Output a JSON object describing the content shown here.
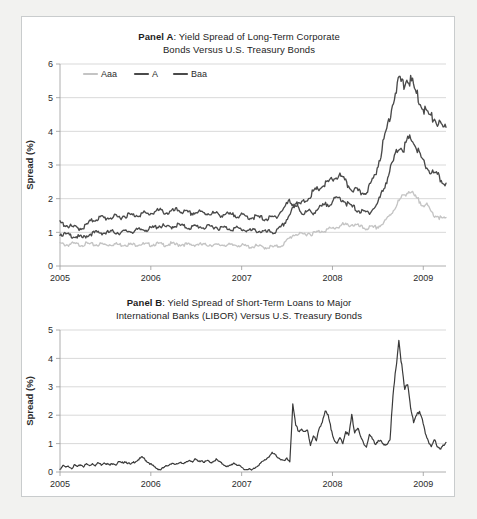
{
  "figure": {
    "background_color": "#ffffff",
    "frame_color": "#c9cccd",
    "page_color": "#f2f2f0"
  },
  "panel_a": {
    "title_bold": "Panel A",
    "title_rest": ": Yield Spread of Long-Term Corporate",
    "title_line2": "Bonds Versus U.S. Treasury Bonds",
    "ylabel": "Spread (%)",
    "legend": [
      {
        "label": "Aaa",
        "color": "#c4c4c4"
      },
      {
        "label": "A",
        "color": "#4a4a4a"
      },
      {
        "label": "Baa",
        "color": "#4a4a4a"
      }
    ]
  },
  "panel_b": {
    "title_bold": "Panel B",
    "title_rest": ": Yield Spread of Short-Term Loans to Major",
    "title_line2": "International Banks (LIBOR) Versus U.S. Treasury Bonds",
    "ylabel": "Spread (%)",
    "line_color": "#3a3a3a"
  },
  "chart_data": [
    {
      "type": "line",
      "title": "Panel A: Yield Spread of Long-Term Corporate Bonds Versus U.S. Treasury Bonds",
      "xlabel": "",
      "ylabel": "Spread (%)",
      "xlim": [
        2005.0,
        2009.25
      ],
      "ylim": [
        0,
        6
      ],
      "yticks": [
        0,
        1,
        2,
        3,
        4,
        5,
        6
      ],
      "xticks": [
        2005,
        2006,
        2007,
        2008,
        2009
      ],
      "xtick_labels": [
        "2005",
        "2006",
        "2007",
        "2008",
        "2009"
      ],
      "grid": true,
      "legend_position": "top-left-inside",
      "x": [
        2005.0,
        2005.04,
        2005.08,
        2005.12,
        2005.17,
        2005.21,
        2005.25,
        2005.29,
        2005.33,
        2005.38,
        2005.42,
        2005.46,
        2005.5,
        2005.54,
        2005.58,
        2005.62,
        2005.67,
        2005.71,
        2005.75,
        2005.79,
        2005.83,
        2005.88,
        2005.92,
        2005.96,
        2006.0,
        2006.04,
        2006.08,
        2006.12,
        2006.17,
        2006.21,
        2006.25,
        2006.29,
        2006.33,
        2006.38,
        2006.42,
        2006.46,
        2006.5,
        2006.54,
        2006.58,
        2006.62,
        2006.67,
        2006.71,
        2006.75,
        2006.79,
        2006.83,
        2006.88,
        2006.92,
        2006.96,
        2007.0,
        2007.04,
        2007.08,
        2007.12,
        2007.17,
        2007.21,
        2007.25,
        2007.29,
        2007.33,
        2007.38,
        2007.42,
        2007.46,
        2007.5,
        2007.54,
        2007.58,
        2007.62,
        2007.67,
        2007.71,
        2007.75,
        2007.79,
        2007.83,
        2007.88,
        2007.92,
        2007.96,
        2008.0,
        2008.04,
        2008.08,
        2008.12,
        2008.17,
        2008.21,
        2008.25,
        2008.29,
        2008.33,
        2008.38,
        2008.42,
        2008.46,
        2008.5,
        2008.54,
        2008.58,
        2008.62,
        2008.67,
        2008.71,
        2008.75,
        2008.79,
        2008.83,
        2008.88,
        2008.92,
        2008.96,
        2009.0,
        2009.04,
        2009.08,
        2009.12,
        2009.17,
        2009.21
      ],
      "series": [
        {
          "name": "Aaa",
          "color": "#c4c4c4",
          "values": [
            0.66,
            0.64,
            0.63,
            0.66,
            0.65,
            0.63,
            0.64,
            0.66,
            0.64,
            0.63,
            0.64,
            0.65,
            0.63,
            0.64,
            0.66,
            0.64,
            0.63,
            0.65,
            0.64,
            0.63,
            0.64,
            0.66,
            0.64,
            0.63,
            0.64,
            0.66,
            0.65,
            0.63,
            0.64,
            0.66,
            0.64,
            0.63,
            0.65,
            0.64,
            0.62,
            0.63,
            0.65,
            0.63,
            0.62,
            0.64,
            0.63,
            0.61,
            0.62,
            0.64,
            0.62,
            0.61,
            0.63,
            0.62,
            0.6,
            0.58,
            0.57,
            0.59,
            0.58,
            0.56,
            0.55,
            0.57,
            0.56,
            0.58,
            0.62,
            0.7,
            0.82,
            0.92,
            0.96,
            0.92,
            0.95,
            0.98,
            0.96,
            0.99,
            1.03,
            1.06,
            1.08,
            1.1,
            1.14,
            1.18,
            1.22,
            1.2,
            1.24,
            1.22,
            1.18,
            1.14,
            1.12,
            1.14,
            1.12,
            1.16,
            1.22,
            1.3,
            1.46,
            1.62,
            1.82,
            1.96,
            2.1,
            2.24,
            2.16,
            2.02,
            1.92,
            1.86,
            1.78,
            1.62,
            1.52,
            1.48,
            1.38,
            1.44
          ]
        },
        {
          "name": "A",
          "color": "#4a4a4a",
          "values": [
            0.96,
            0.94,
            0.92,
            0.9,
            0.88,
            0.86,
            0.84,
            0.9,
            0.96,
            0.98,
            1.0,
            0.99,
            0.98,
            1.0,
            1.02,
            1.0,
            0.99,
            1.02,
            1.04,
            1.03,
            1.05,
            1.08,
            1.1,
            1.08,
            1.12,
            1.16,
            1.2,
            1.18,
            1.14,
            1.16,
            1.2,
            1.22,
            1.18,
            1.16,
            1.14,
            1.16,
            1.18,
            1.16,
            1.14,
            1.16,
            1.18,
            1.15,
            1.12,
            1.14,
            1.12,
            1.1,
            1.12,
            1.1,
            1.08,
            1.06,
            1.04,
            1.06,
            1.04,
            1.02,
            1.0,
            1.02,
            1.0,
            1.06,
            1.16,
            1.32,
            1.52,
            1.7,
            1.88,
            1.62,
            1.56,
            1.62,
            1.58,
            1.66,
            1.72,
            1.78,
            1.84,
            1.9,
            1.96,
            2.02,
            1.98,
            1.86,
            1.78,
            1.72,
            1.66,
            1.6,
            1.58,
            1.62,
            1.7,
            1.84,
            2.1,
            2.4,
            2.72,
            3.04,
            3.36,
            3.58,
            3.48,
            3.72,
            3.8,
            3.56,
            3.32,
            3.08,
            2.92,
            2.8,
            2.72,
            2.66,
            2.5,
            2.46
          ]
        },
        {
          "name": "Baa",
          "color": "#4a4a4a",
          "values": [
            1.28,
            1.24,
            1.2,
            1.16,
            1.14,
            1.12,
            1.14,
            1.22,
            1.32,
            1.38,
            1.42,
            1.44,
            1.42,
            1.44,
            1.46,
            1.44,
            1.46,
            1.5,
            1.52,
            1.5,
            1.52,
            1.54,
            1.56,
            1.54,
            1.58,
            1.62,
            1.64,
            1.62,
            1.58,
            1.6,
            1.64,
            1.66,
            1.62,
            1.58,
            1.56,
            1.58,
            1.6,
            1.58,
            1.56,
            1.58,
            1.56,
            1.54,
            1.52,
            1.54,
            1.52,
            1.5,
            1.52,
            1.5,
            1.48,
            1.46,
            1.44,
            1.46,
            1.44,
            1.42,
            1.4,
            1.42,
            1.44,
            1.52,
            1.64,
            1.78,
            1.92,
            1.84,
            1.78,
            1.84,
            1.92,
            2.04,
            2.16,
            2.24,
            2.32,
            2.4,
            2.46,
            2.54,
            2.62,
            2.7,
            2.58,
            2.44,
            2.32,
            2.26,
            2.2,
            2.16,
            2.22,
            2.36,
            2.58,
            2.92,
            3.36,
            3.84,
            4.32,
            4.82,
            5.28,
            5.52,
            5.36,
            5.58,
            5.46,
            5.18,
            4.92,
            4.7,
            4.56,
            4.42,
            4.36,
            4.24,
            4.06,
            4.12
          ]
        }
      ]
    },
    {
      "type": "line",
      "title": "Panel B: Yield Spread of Short-Term Loans to Major International Banks (LIBOR) Versus U.S. Treasury Bonds",
      "xlabel": "",
      "ylabel": "Spread (%)",
      "xlim": [
        2005.0,
        2009.25
      ],
      "ylim": [
        0,
        5
      ],
      "yticks": [
        0,
        1,
        2,
        3,
        4,
        5
      ],
      "xticks": [
        2005,
        2006,
        2007,
        2008,
        2009
      ],
      "xtick_labels": [
        "2005",
        "2006",
        "2007",
        "2008",
        "2009"
      ],
      "grid": true,
      "series": [
        {
          "name": "LIBOR spread",
          "color": "#3a3a3a",
          "values": [
            0.1,
            0.22,
            0.16,
            0.2,
            0.14,
            0.24,
            0.18,
            0.26,
            0.2,
            0.28,
            0.22,
            0.3,
            0.24,
            0.32,
            0.26,
            0.34,
            0.28,
            0.24,
            0.32,
            0.26,
            0.36,
            0.3,
            0.38,
            0.32,
            0.26,
            0.34,
            0.4,
            0.46,
            0.52,
            0.42,
            0.34,
            0.26,
            0.18,
            0.12,
            0.08,
            0.14,
            0.2,
            0.26,
            0.32,
            0.24,
            0.3,
            0.36,
            0.28,
            0.34,
            0.42,
            0.38,
            0.44,
            0.36,
            0.42,
            0.34,
            0.4,
            0.32,
            0.38,
            0.44,
            0.36,
            0.3,
            0.24,
            0.18,
            0.24,
            0.32,
            0.26,
            0.2,
            0.14,
            0.08,
            0.12,
            0.06,
            0.14,
            0.22,
            0.3,
            0.38,
            0.46,
            0.56,
            0.66,
            0.6,
            0.52,
            0.44,
            0.38,
            0.46,
            0.38,
            2.34,
            1.62,
            1.44,
            1.52,
            1.38,
            1.46,
            0.96,
            1.3,
            1.08,
            1.54,
            1.8,
            2.12,
            1.96,
            1.52,
            1.18,
            0.96,
            1.2,
            1.04,
            1.44,
            1.26,
            1.98,
            1.42,
            1.56
          ],
          "values_cont": [
            1.22,
            1.04,
            0.88,
            1.32,
            1.16,
            0.98,
            1.12,
            1.06,
            0.92,
            1.0,
            1.18,
            2.62,
            3.64,
            4.66,
            3.7,
            2.86,
            3.12,
            2.3,
            1.72,
            1.96,
            2.14,
            1.9,
            1.3,
            1.06,
            0.92,
            1.18,
            0.86,
            0.82,
            0.96,
            1.04
          ]
        }
      ],
      "annotations": [
        {
          "text": "peak",
          "x": 2008.72,
          "y": 4.66
        }
      ]
    }
  ]
}
